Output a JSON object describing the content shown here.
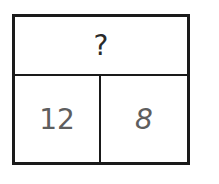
{
  "diagram": {
    "type": "part-whole bar model",
    "whole": "?",
    "parts": [
      "12",
      "8"
    ],
    "colors": {
      "border": "#1a1a1a",
      "whole_text": "#2a2a2a",
      "part_text": "#5e5e5e"
    }
  }
}
